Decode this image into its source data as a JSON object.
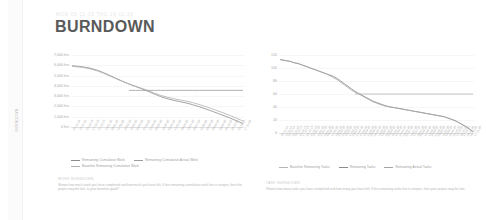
{
  "report": {
    "meta_line": "MON 05-11-19     THU 19-11-20",
    "title": "BURNDOWN",
    "side_tab_label": "BURNDOWN"
  },
  "chart_data": [
    {
      "id": "work-burndown",
      "type": "line",
      "title": "",
      "xlabel": "",
      "ylabel": "",
      "ylim": [
        0,
        7000
      ],
      "grid": true,
      "legend_position": "bottom-left",
      "ytick_labels": [
        "7,000 hrs",
        "6,000 hrs",
        "5,000 hrs",
        "4,000 hrs",
        "3,000 hrs",
        "2,000 hrs",
        "1,000 hrs",
        "0 hrs"
      ],
      "yticks": [
        7000,
        6000,
        5000,
        4000,
        3000,
        2000,
        1000,
        0
      ],
      "categories": [
        "05-11-19",
        "19-11-19",
        "03-12-19",
        "17-12-19",
        "31-12-19",
        "14-01-20",
        "28-01-20",
        "11-02-20",
        "25-02-20",
        "10-03-20",
        "24-03-20",
        "07-04-20",
        "21-04-20",
        "05-05-20",
        "19-05-20",
        "02-06-20",
        "16-06-20",
        "30-06-20",
        "14-07-20",
        "28-07-20",
        "11-08-20",
        "25-08-20",
        "08-09-20",
        "22-09-20",
        "06-10-20",
        "20-10-20",
        "03-11-20",
        "17-11-20"
      ],
      "series": [
        {
          "name": "Remaining Cumulative Work",
          "color": "#8c8c8c",
          "values": [
            5950,
            5900,
            5820,
            5700,
            5520,
            5280,
            5000,
            4720,
            4440,
            4180,
            3950,
            3720,
            3480,
            3200,
            2960,
            2760,
            2600,
            2470,
            2340,
            2180,
            1990,
            1780,
            1560,
            1330,
            1100,
            860,
            600,
            330
          ]
        },
        {
          "name": "Baseline Remaining Cumulative Work",
          "color": "#b0b0b0",
          "values": [
            5900,
            5840,
            5760,
            5630,
            5450,
            5220,
            4950,
            4680,
            4420,
            4180,
            3960,
            3760,
            3540,
            3300,
            3080,
            2900,
            2760,
            2640,
            2520,
            2380,
            2200,
            2000,
            1790,
            1570,
            1350,
            1110,
            850,
            580
          ]
        },
        {
          "name": "Remaining Cumulative Actual Work",
          "color": "#9e9e9e",
          "values": [
            null,
            null,
            null,
            null,
            null,
            null,
            null,
            null,
            null,
            3560,
            3560,
            3560,
            3560,
            3560,
            3560,
            3560,
            3560,
            3560,
            3560,
            3560,
            3560,
            3560,
            3560,
            3560,
            3560,
            3560,
            3560,
            3560
          ]
        }
      ],
      "legend": [
        {
          "label": "Remaining Cumulative Work",
          "color": "#8c8c8c"
        },
        {
          "label": "Remaining Cumulative Actual Work",
          "color": "#9e9e9e"
        },
        {
          "label": "Baseline Remaining Cumulative Work",
          "color": "#b0b0b0"
        }
      ],
      "note_title": "WORK BURNDOWN",
      "note_body": "Shows how much work you have completed and how much you have left. If the remaining cumulative work line is steeper, then the project may be late. Is your baseline good?"
    },
    {
      "id": "task-burndown",
      "type": "line",
      "title": "",
      "xlabel": "",
      "ylabel": "",
      "ylim": [
        0,
        120
      ],
      "grid": true,
      "legend_position": "bottom-center",
      "ytick_labels": [
        "120",
        "100",
        "80",
        "60",
        "40",
        "20",
        "0"
      ],
      "yticks": [
        120,
        100,
        80,
        60,
        40,
        20,
        0
      ],
      "categories": [
        "05-11-19",
        "12-11-19",
        "19-11-19",
        "26-11-19",
        "03-12-19",
        "10-12-19",
        "17-12-19",
        "24-12-19",
        "31-12-19",
        "07-01-20",
        "14-01-20",
        "21-01-20",
        "28-01-20",
        "04-02-20",
        "11-02-20",
        "18-02-20",
        "25-02-20",
        "03-03-20",
        "10-03-20",
        "17-03-20",
        "24-03-20",
        "31-03-20",
        "07-04-20",
        "14-04-20",
        "21-04-20",
        "28-04-20",
        "05-05-20",
        "12-05-20",
        "19-05-20",
        "26-05-20",
        "02-06-20",
        "09-06-20",
        "16-06-20",
        "23-06-20",
        "30-06-20",
        "07-07-20",
        "14-07-20",
        "21-07-20",
        "28-07-20",
        "04-08-20",
        "11-08-20",
        "18-08-20",
        "25-08-20",
        "01-09-20",
        "08-09-20",
        "15-09-20",
        "22-09-20",
        "29-09-20",
        "06-10-20",
        "13-10-20",
        "20-10-20",
        "27-10-20",
        "03-11-20",
        "10-11-20",
        "17-11-20"
      ],
      "series": [
        {
          "name": "Remaining Tasks",
          "color": "#8c8c8c",
          "values": [
            113,
            112,
            111,
            110,
            108,
            107,
            105,
            103,
            101,
            99,
            97,
            95,
            93,
            91,
            89,
            87,
            84,
            80,
            76,
            72,
            68,
            64,
            61,
            58,
            55,
            52,
            49,
            47,
            45,
            43,
            41,
            40,
            39,
            38,
            37,
            36,
            35,
            34,
            33,
            32,
            31,
            30,
            29,
            28,
            27,
            26,
            25,
            23,
            21,
            19,
            16,
            13,
            10,
            6,
            2
          ]
        },
        {
          "name": "Remaining Actual Tasks",
          "color": "#a5a5a5",
          "values": [
            113,
            112,
            111,
            110,
            108,
            107,
            105,
            103,
            101,
            99,
            97,
            95,
            93,
            91,
            88,
            85,
            82,
            78,
            74,
            70,
            66,
            63,
            60,
            57,
            54,
            51,
            48,
            46,
            44,
            42,
            41,
            40,
            39,
            38,
            37,
            36,
            35,
            34,
            33,
            32,
            31,
            30,
            29,
            28,
            27,
            26,
            25,
            23,
            21,
            19,
            16,
            13,
            10,
            6,
            2
          ]
        },
        {
          "name": "Baseline Remaining Tasks",
          "color": "#b5b5b5",
          "values": [
            null,
            null,
            null,
            null,
            null,
            null,
            null,
            null,
            null,
            null,
            null,
            null,
            null,
            null,
            null,
            null,
            null,
            null,
            null,
            null,
            null,
            60,
            60,
            60,
            60,
            60,
            60,
            60,
            60,
            60,
            60,
            60,
            60,
            60,
            60,
            60,
            60,
            60,
            60,
            60,
            60,
            60,
            60,
            60,
            60,
            60,
            60,
            60,
            60,
            60,
            60,
            60,
            60,
            60,
            60
          ]
        }
      ],
      "legend": [
        {
          "label": "Baseline Remaining Tasks",
          "color": "#b5b5b5"
        },
        {
          "label": "Remaining Tasks",
          "color": "#8c8c8c"
        },
        {
          "label": "Remaining Actual Tasks",
          "color": "#a5a5a5"
        }
      ],
      "note_title": "TASK BURNDOWN",
      "note_body": "Shows how many tasks you have completed and how many you have left. If the remaining tasks line is steeper, then your project may be late."
    }
  ]
}
